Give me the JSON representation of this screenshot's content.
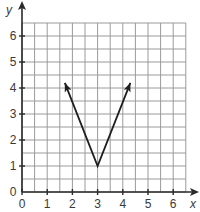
{
  "chart_data": {
    "type": "line",
    "title": "",
    "xlabel": "x",
    "ylabel": "y",
    "xlim": [
      0,
      6.5
    ],
    "ylim": [
      0,
      6.5
    ],
    "grid": true,
    "grid_step": 0.5,
    "x_ticks": [
      "0",
      "1",
      "2",
      "3",
      "4",
      "5",
      "6"
    ],
    "y_ticks": [
      "0",
      "1",
      "2",
      "3",
      "4",
      "5",
      "6"
    ],
    "series": [
      {
        "name": "V-shaped graph",
        "points": [
          [
            1.7,
            4.2
          ],
          [
            3,
            1
          ],
          [
            4.3,
            4.2
          ]
        ],
        "arrows_at_ends": true,
        "vertex": [
          3,
          1
        ]
      }
    ],
    "colors": {
      "grid": "#9a9a9a",
      "axis": "#2a2a2a",
      "line": "#1e1e1e"
    }
  }
}
